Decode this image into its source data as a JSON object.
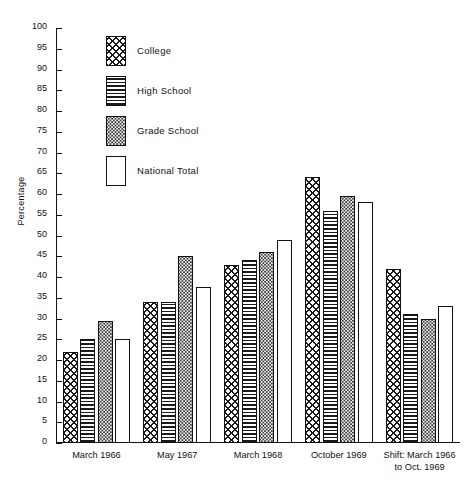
{
  "chart_data": {
    "type": "bar",
    "title": "",
    "xlabel": "",
    "ylabel": "Percentage",
    "ylim": [
      0,
      100
    ],
    "ytick_step": 5,
    "yticks": [
      0,
      5,
      10,
      15,
      20,
      25,
      30,
      35,
      40,
      45,
      50,
      55,
      60,
      65,
      70,
      75,
      80,
      85,
      90,
      95,
      100
    ],
    "grid": false,
    "legend_position": "inside-top-left",
    "categories": [
      "March 1966",
      "May 1967",
      "March 1968",
      "October 1969",
      "Shift: March 1966 to Oct. 1969"
    ],
    "category_lines": [
      [
        "March 1966"
      ],
      [
        "May 1967"
      ],
      [
        "March 1968"
      ],
      [
        "October 1969"
      ],
      [
        "Shift: March 1966",
        "to Oct. 1969"
      ]
    ],
    "series": [
      {
        "name": "College",
        "pattern": "crosshatch",
        "values": [
          22,
          34,
          43,
          64,
          42
        ]
      },
      {
        "name": "High School",
        "pattern": "horizontal-lines",
        "values": [
          25,
          34,
          44,
          56,
          31
        ]
      },
      {
        "name": "Grade School",
        "pattern": "stipple-dots",
        "values": [
          29.5,
          45,
          46,
          59.5,
          30
        ]
      },
      {
        "name": "National Total",
        "pattern": "solid-white",
        "values": [
          25,
          37.5,
          49,
          58,
          33
        ]
      }
    ]
  },
  "legend": {
    "items": [
      {
        "label": "College"
      },
      {
        "label": "High School"
      },
      {
        "label": "Grade School"
      },
      {
        "label": "National Total"
      }
    ]
  },
  "colors": {
    "ink": "#1a1a1a",
    "background": "#ffffff",
    "stipple": "#f2f2f2"
  }
}
